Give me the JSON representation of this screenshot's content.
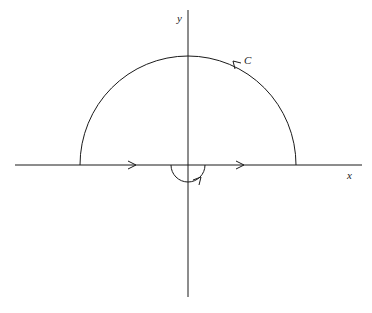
{
  "diagram": {
    "title": "",
    "labels": {
      "y_axis": "y",
      "x_axis": "x",
      "contour": "C"
    },
    "colors": {
      "stroke": "#1a1a1a",
      "background": "#ffffff"
    },
    "geometry": {
      "origin": [
        188,
        165
      ],
      "large_radius": 108,
      "small_radius": 17,
      "x_axis_range": [
        15,
        362
      ],
      "y_axis_range": [
        10,
        297
      ]
    }
  }
}
